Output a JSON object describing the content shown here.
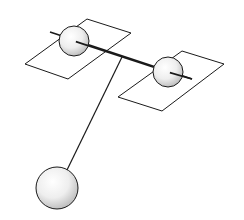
{
  "diagram": {
    "title": "",
    "colors": {
      "background": "#ffffff",
      "stroke": "#1a1a1a",
      "plate_fill": "#ffffff",
      "sphere_light": "#ffffff",
      "sphere_dark": "#b8b8b8"
    },
    "elements": {
      "left_plate": {
        "points": [
          [
            25,
            64
          ],
          [
            68,
            79
          ],
          [
            131,
            33
          ],
          [
            87,
            19
          ]
        ]
      },
      "right_plate": {
        "points": [
          [
            118,
            97
          ],
          [
            162,
            111
          ],
          [
            224,
            64
          ],
          [
            182,
            51
          ]
        ]
      },
      "rod": {
        "x1": 50,
        "y1": 32,
        "x2": 192,
        "y2": 79
      },
      "left_sphere": {
        "cx": 74,
        "cy": 41,
        "r": 15
      },
      "right_sphere": {
        "cx": 168,
        "cy": 72,
        "r": 15
      },
      "pendulum_string": {
        "x1": 122,
        "y1": 57,
        "x2": 67,
        "y2": 170
      },
      "pendulum_bob": {
        "cx": 57,
        "cy": 188,
        "r": 21
      }
    }
  }
}
